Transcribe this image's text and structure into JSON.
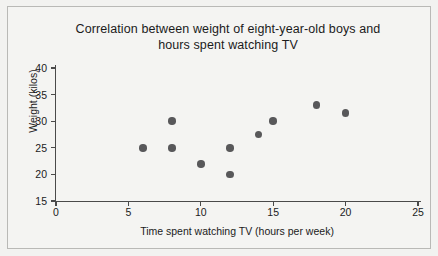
{
  "chart_data": {
    "type": "scatter",
    "title": "Correlation between weight of eight-year-old boys and hours spent watching TV",
    "title_line1": "Correlation between weight of eight-year-old boys and",
    "title_line2": "hours spent watching TV",
    "xlabel": "Time spent watching TV (hours per week)",
    "ylabel": "Weight (kilos)",
    "xlim": [
      0,
      25
    ],
    "ylim": [
      15,
      40
    ],
    "xticks": [
      0,
      5,
      10,
      15,
      20,
      25
    ],
    "yticks": [
      15,
      20,
      25,
      30,
      35,
      40
    ],
    "xtick_labels": [
      "0",
      "5",
      "10",
      "15",
      "20",
      "25"
    ],
    "ytick_labels": [
      "15",
      "20",
      "25",
      "30",
      "35",
      "40"
    ],
    "grid": false,
    "legend": "none",
    "marker_color": "#58585a",
    "points": [
      {
        "x": 6,
        "y": 25
      },
      {
        "x": 8,
        "y": 30
      },
      {
        "x": 8,
        "y": 25
      },
      {
        "x": 10,
        "y": 22
      },
      {
        "x": 12,
        "y": 25
      },
      {
        "x": 12,
        "y": 20
      },
      {
        "x": 14,
        "y": 27.5
      },
      {
        "x": 15,
        "y": 30
      },
      {
        "x": 18,
        "y": 33
      },
      {
        "x": 20,
        "y": 31.5
      }
    ],
    "x": [
      6,
      8,
      8,
      10,
      12,
      12,
      14,
      15,
      18,
      20
    ],
    "y": [
      25,
      30,
      25,
      22,
      25,
      20,
      27.5,
      30,
      33,
      31.5
    ]
  },
  "colors": {
    "background": "#f2f2f0",
    "panel": "#f4f4f2",
    "axis": "#4a4a4a",
    "text": "#1b1b1b",
    "marker": "#58585a",
    "frame_border": "#b9b9b6"
  }
}
